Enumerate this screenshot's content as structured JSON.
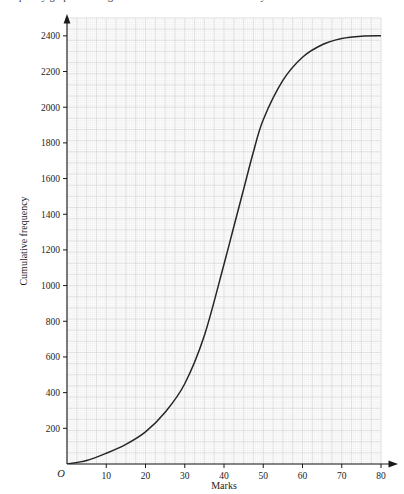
{
  "caption": {
    "text": "frequency graph showing the distribution of marks scored by the students."
  },
  "figure": {
    "origin_label": "O"
  },
  "colors": {
    "curve": "#262626",
    "axis": "#1a1a1a",
    "grid_minor": "#ececec",
    "grid_major": "#d9d9d9",
    "background": "#ffffff",
    "text": "#1c1c1c"
  },
  "chart_data": {
    "type": "line",
    "title": "",
    "subtitle": "",
    "xlabel": "Marks",
    "ylabel": "Cumulative frequency",
    "xlim": [
      0,
      80
    ],
    "ylim": [
      0,
      2500
    ],
    "xticks": [
      0,
      10,
      20,
      30,
      40,
      50,
      60,
      70,
      80
    ],
    "xtick_labels": [
      "O",
      "10",
      "20",
      "30",
      "40",
      "50",
      "60",
      "70",
      "80"
    ],
    "yticks": [
      200,
      400,
      600,
      800,
      1000,
      1200,
      1400,
      1600,
      1800,
      2000,
      2200,
      2400
    ],
    "ytick_labels": [
      "200",
      "400",
      "600",
      "800",
      "1000",
      "1200",
      "1400",
      "1600",
      "1800",
      "2000",
      "2200",
      "2400"
    ],
    "grid": true,
    "grid_minor_step_x": 0.5,
    "grid_minor_step_y": 12.5,
    "grid_major_step_x": 2.5,
    "grid_major_step_y": 62.5,
    "legend": null,
    "series": [
      {
        "name": "Cumulative frequency",
        "x": [
          0,
          5,
          10,
          15,
          20,
          25,
          30,
          35,
          40,
          42.5,
          45,
          47.5,
          50,
          55,
          60,
          65,
          70,
          75,
          80
        ],
        "y": [
          0,
          20,
          60,
          110,
          180,
          290,
          450,
          720,
          1120,
          1330,
          1540,
          1750,
          1930,
          2150,
          2280,
          2350,
          2385,
          2398,
          2400
        ]
      }
    ],
    "annotations": []
  }
}
